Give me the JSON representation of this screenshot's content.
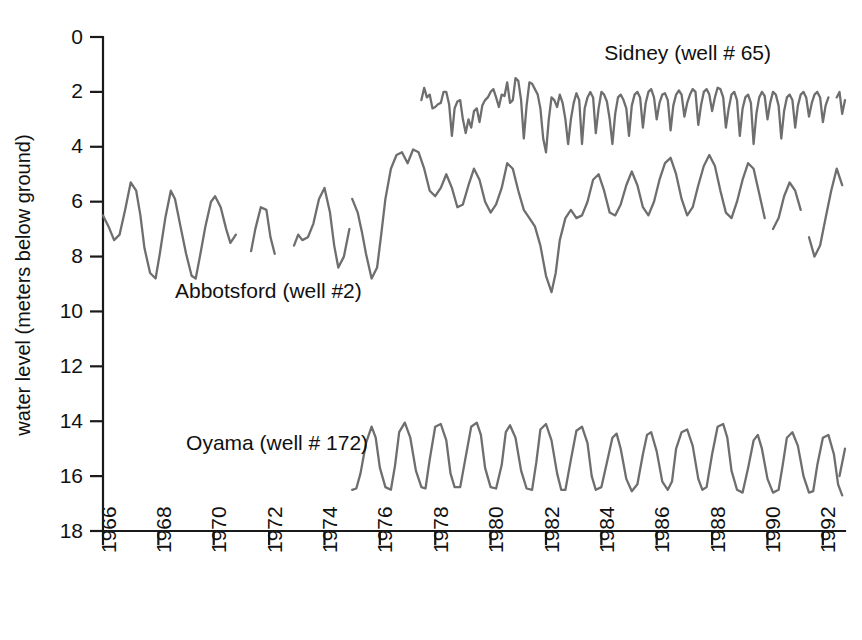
{
  "chart_data": {
    "type": "line",
    "title": "",
    "xlabel": "",
    "ylabel": "water level (meters below ground)",
    "ylim": [
      0,
      18
    ],
    "y_inverted": true,
    "xlim": [
      1966,
      1992.8
    ],
    "grid": false,
    "legend": "inline-annotations",
    "y_ticks": [
      0,
      2,
      4,
      6,
      8,
      10,
      12,
      14,
      16,
      18
    ],
    "x_ticks": [
      1966,
      1968,
      1970,
      1972,
      1974,
      1976,
      1978,
      1980,
      1982,
      1984,
      1986,
      1988,
      1990,
      1992
    ],
    "series": [
      {
        "name": "Abbotsford (well #2)",
        "color": "#6e6e6e",
        "label": "Abbotsford (well #2)",
        "label_x": 1968.6,
        "label_y": 9.5,
        "segments": [
          {
            "x": [
              1966.0,
              1966.2,
              1966.4,
              1966.6,
              1966.8,
              1967.0,
              1967.2,
              1967.35,
              1967.5,
              1967.7,
              1967.9,
              1968.05,
              1968.25,
              1968.45,
              1968.6,
              1968.8,
              1969.0,
              1969.2,
              1969.35,
              1969.5,
              1969.7,
              1969.9,
              1970.05,
              1970.25,
              1970.45,
              1970.6,
              1970.8
            ],
            "y": [
              6.5,
              6.9,
              7.4,
              7.2,
              6.3,
              5.3,
              5.6,
              6.5,
              7.7,
              8.6,
              8.8,
              7.9,
              6.6,
              5.6,
              5.9,
              6.9,
              7.9,
              8.7,
              8.8,
              8.0,
              6.9,
              6.0,
              5.8,
              6.2,
              7.0,
              7.5,
              7.2
            ]
          },
          {
            "x": [
              1971.35,
              1971.5,
              1971.7,
              1971.9,
              1972.05,
              1972.2
            ],
            "y": [
              7.8,
              7.0,
              6.2,
              6.3,
              7.3,
              7.9
            ]
          },
          {
            "x": [
              1972.9,
              1973.05,
              1973.2,
              1973.4,
              1973.6,
              1973.8,
              1974.0,
              1974.2,
              1974.35,
              1974.5,
              1974.7,
              1974.9
            ],
            "y": [
              7.6,
              7.2,
              7.4,
              7.3,
              6.8,
              5.9,
              5.5,
              6.4,
              7.6,
              8.4,
              8.0,
              7.0
            ]
          },
          {
            "x": [
              1975.0,
              1975.2,
              1975.35,
              1975.5,
              1975.7,
              1975.9,
              1976.05,
              1976.2,
              1976.4,
              1976.6,
              1976.8,
              1977.0,
              1977.2,
              1977.4,
              1977.6,
              1977.8,
              1978.0,
              1978.2,
              1978.4,
              1978.6,
              1978.8,
              1979.0,
              1979.2,
              1979.4,
              1979.6,
              1979.8,
              1980.0,
              1980.2,
              1980.4,
              1980.6,
              1980.8,
              1981.0,
              1981.2,
              1981.4,
              1981.6,
              1981.8,
              1982.0,
              1982.2,
              1982.35,
              1982.5,
              1982.7,
              1982.9,
              1983.1,
              1983.3,
              1983.5,
              1983.7,
              1983.9,
              1984.1,
              1984.3,
              1984.5,
              1984.7,
              1984.9,
              1985.1,
              1985.3,
              1985.5,
              1985.7,
              1985.9,
              1986.1,
              1986.3,
              1986.5,
              1986.7,
              1986.9,
              1987.1,
              1987.3,
              1987.5,
              1987.7,
              1987.9,
              1988.1,
              1988.3,
              1988.5,
              1988.7,
              1988.9,
              1989.1,
              1989.3,
              1989.5,
              1989.7,
              1989.9
            ],
            "y": [
              5.9,
              6.4,
              7.1,
              7.9,
              8.8,
              8.4,
              7.2,
              5.9,
              4.8,
              4.3,
              4.2,
              4.6,
              4.1,
              4.2,
              4.8,
              5.6,
              5.8,
              5.5,
              5.0,
              5.5,
              6.2,
              6.1,
              5.4,
              4.8,
              5.2,
              6.0,
              6.4,
              6.1,
              5.5,
              4.6,
              4.8,
              5.6,
              6.3,
              6.6,
              6.9,
              7.6,
              8.7,
              9.3,
              8.6,
              7.4,
              6.6,
              6.3,
              6.6,
              6.5,
              6.0,
              5.2,
              5.0,
              5.6,
              6.4,
              6.5,
              6.1,
              5.4,
              4.9,
              5.4,
              6.2,
              6.5,
              6.0,
              5.2,
              4.6,
              4.4,
              5.0,
              5.9,
              6.5,
              6.2,
              5.4,
              4.7,
              4.3,
              4.7,
              5.6,
              6.4,
              6.6,
              6.0,
              5.2,
              4.6,
              4.8,
              5.7,
              6.6
            ]
          },
          {
            "x": [
              1990.2,
              1990.4,
              1990.6,
              1990.8,
              1991.0,
              1991.2
            ],
            "y": [
              7.0,
              6.6,
              5.8,
              5.3,
              5.6,
              6.3
            ]
          },
          {
            "x": [
              1991.5,
              1991.7,
              1991.9,
              1992.1,
              1992.3,
              1992.5,
              1992.7
            ],
            "y": [
              7.3,
              8.0,
              7.6,
              6.6,
              5.6,
              4.8,
              5.4
            ]
          }
        ]
      },
      {
        "name": "Sidney (well # 65)",
        "color": "#6e6e6e",
        "label": "Sidney (well # 65)",
        "label_x": 1984.1,
        "label_y": 0.85,
        "segments": [
          {
            "x": [
              1977.5,
              1977.6,
              1977.7,
              1977.8,
              1977.9,
              1978.0,
              1978.1,
              1978.2,
              1978.3,
              1978.4,
              1978.5,
              1978.6,
              1978.7,
              1978.8,
              1978.9,
              1979.0,
              1979.1,
              1979.2,
              1979.3,
              1979.4,
              1979.5,
              1979.6,
              1979.7,
              1979.8,
              1979.9,
              1980.0,
              1980.1,
              1980.2,
              1980.3,
              1980.4,
              1980.5,
              1980.6,
              1980.7,
              1980.8,
              1980.9,
              1981.0,
              1981.1,
              1981.2,
              1981.3,
              1981.4,
              1981.5,
              1981.6,
              1981.7,
              1981.8,
              1981.9,
              1982.0,
              1982.1,
              1982.2,
              1982.3,
              1982.4,
              1982.5,
              1982.6,
              1982.7,
              1982.8,
              1982.9,
              1983.0,
              1983.1,
              1983.2,
              1983.3,
              1983.4,
              1983.5,
              1983.6,
              1983.7,
              1983.8,
              1983.9,
              1984.0,
              1984.1,
              1984.2,
              1984.3,
              1984.4,
              1984.5,
              1984.6,
              1984.7,
              1984.8,
              1984.9,
              1985.0,
              1985.1,
              1985.2,
              1985.3,
              1985.4,
              1985.5,
              1985.6,
              1985.7,
              1985.8,
              1985.9,
              1986.0,
              1986.1,
              1986.2,
              1986.3,
              1986.4,
              1986.5,
              1986.6,
              1986.7,
              1986.8,
              1986.9,
              1987.0,
              1987.1,
              1987.2,
              1987.3,
              1987.4,
              1987.5,
              1987.6,
              1987.7,
              1987.8,
              1987.9,
              1988.0,
              1988.1,
              1988.2,
              1988.3,
              1988.4,
              1988.5,
              1988.6,
              1988.7,
              1988.8,
              1988.9,
              1989.0,
              1989.1,
              1989.2,
              1989.3,
              1989.4,
              1989.5,
              1989.6,
              1989.7,
              1989.8,
              1989.9,
              1990.0,
              1990.1,
              1990.2,
              1990.3,
              1990.4,
              1990.5,
              1990.6,
              1990.7,
              1990.8,
              1990.9,
              1991.0,
              1991.1,
              1991.2,
              1991.3,
              1991.4,
              1991.5,
              1991.6,
              1991.7,
              1991.8,
              1991.9,
              1992.0,
              1992.1,
              1992.2,
              1992.3
            ],
            "y": [
              2.3,
              1.85,
              2.2,
              2.1,
              2.6,
              2.55,
              2.45,
              2.4,
              2.0,
              2.0,
              2.45,
              3.6,
              2.6,
              2.35,
              2.3,
              3.0,
              3.5,
              3.0,
              3.3,
              2.7,
              2.6,
              3.1,
              2.5,
              2.3,
              2.2,
              2.0,
              1.9,
              2.2,
              2.55,
              2.1,
              2.15,
              1.65,
              2.4,
              2.3,
              1.5,
              1.6,
              2.3,
              3.7,
              2.5,
              1.65,
              1.7,
              1.9,
              2.1,
              2.6,
              3.7,
              4.2,
              3.0,
              2.2,
              2.3,
              2.55,
              2.1,
              2.4,
              3.0,
              3.9,
              3.0,
              2.4,
              2.05,
              2.3,
              3.9,
              2.6,
              2.2,
              2.0,
              2.2,
              3.5,
              2.6,
              2.0,
              2.1,
              2.35,
              3.0,
              3.9,
              2.8,
              2.2,
              2.1,
              2.3,
              2.6,
              3.6,
              2.5,
              2.1,
              2.0,
              2.2,
              3.3,
              2.4,
              2.0,
              1.9,
              2.2,
              3.0,
              2.4,
              2.1,
              2.05,
              2.3,
              3.4,
              2.5,
              2.1,
              1.95,
              2.1,
              2.9,
              2.4,
              2.1,
              1.9,
              2.0,
              3.2,
              2.5,
              2.0,
              1.9,
              2.1,
              2.7,
              2.2,
              1.85,
              1.9,
              2.2,
              3.3,
              2.6,
              2.1,
              2.0,
              2.3,
              3.6,
              2.6,
              2.2,
              2.1,
              2.4,
              3.9,
              2.8,
              2.2,
              2.0,
              2.15,
              3.0,
              2.4,
              2.0,
              2.1,
              2.5,
              3.7,
              2.7,
              2.2,
              2.1,
              2.3,
              3.3,
              2.5,
              2.1,
              2.0,
              2.2,
              2.9,
              2.4,
              2.1,
              2.0,
              2.2,
              3.1,
              2.5,
              2.2
            ]
          },
          {
            "x": [
              1992.5,
              1992.6,
              1992.7,
              1992.8
            ],
            "y": [
              2.2,
              2.0,
              2.8,
              2.3
            ]
          }
        ]
      },
      {
        "name": "Oyama (well # 172)",
        "color": "#6e6e6e",
        "label": "Oyama (well # 172)",
        "label_x": 1969.0,
        "label_y": 15.05,
        "segments": [
          {
            "x": [
              1975.0,
              1975.15,
              1975.3,
              1975.5,
              1975.7,
              1975.85,
              1976.0,
              1976.2,
              1976.4,
              1976.55,
              1976.7,
              1976.9,
              1977.1,
              1977.3,
              1977.5,
              1977.65,
              1977.8,
              1978.0,
              1978.2,
              1978.4,
              1978.55,
              1978.7,
              1978.9,
              1979.1,
              1979.3,
              1979.5,
              1979.65,
              1979.8,
              1980.0,
              1980.2,
              1980.4,
              1980.55,
              1980.7,
              1980.9,
              1981.1,
              1981.3,
              1981.5,
              1981.65,
              1981.8,
              1982.0,
              1982.2,
              1982.4,
              1982.55,
              1982.7,
              1982.9,
              1983.1,
              1983.3,
              1983.5,
              1983.65,
              1983.8,
              1984.0,
              1984.2,
              1984.4,
              1984.55,
              1984.7,
              1984.9,
              1985.1,
              1985.3,
              1985.5,
              1985.65,
              1985.8,
              1986.0,
              1986.2,
              1986.4,
              1986.55,
              1986.7,
              1986.9,
              1987.1,
              1987.3,
              1987.5,
              1987.65,
              1987.8,
              1988.0,
              1988.2,
              1988.4,
              1988.55,
              1988.7,
              1988.9,
              1989.1,
              1989.3,
              1989.5,
              1989.65,
              1989.8,
              1990.0,
              1990.2,
              1990.4,
              1990.55,
              1990.7,
              1990.9,
              1991.1,
              1991.3,
              1991.5,
              1991.65,
              1991.8,
              1992.0,
              1992.2,
              1992.4,
              1992.55,
              1992.7
            ],
            "y": [
              16.5,
              16.45,
              15.9,
              14.8,
              14.2,
              14.6,
              15.7,
              16.4,
              16.5,
              15.6,
              14.4,
              14.05,
              14.6,
              15.8,
              16.4,
              16.45,
              15.4,
              14.2,
              14.1,
              14.7,
              15.9,
              16.4,
              16.4,
              15.3,
              14.2,
              14.05,
              14.5,
              15.7,
              16.4,
              16.45,
              15.6,
              14.4,
              14.15,
              14.6,
              15.8,
              16.45,
              16.5,
              15.5,
              14.3,
              14.1,
              14.7,
              15.9,
              16.5,
              16.5,
              15.4,
              14.35,
              14.2,
              14.8,
              16.0,
              16.5,
              16.4,
              15.5,
              14.6,
              14.45,
              15.0,
              16.1,
              16.55,
              16.3,
              15.2,
              14.5,
              14.4,
              15.1,
              16.2,
              16.5,
              16.2,
              15.0,
              14.4,
              14.3,
              14.9,
              16.1,
              16.5,
              16.4,
              15.2,
              14.2,
              14.1,
              14.6,
              15.8,
              16.5,
              16.6,
              15.7,
              14.7,
              14.5,
              15.0,
              16.1,
              16.6,
              16.5,
              15.6,
              14.6,
              14.4,
              14.9,
              16.0,
              16.6,
              16.55,
              15.6,
              14.6,
              14.5,
              15.2,
              16.3,
              16.7
            ]
          },
          {
            "x": [
              1992.6,
              1992.8
            ],
            "y": [
              16.0,
              15.0
            ]
          }
        ]
      }
    ]
  }
}
